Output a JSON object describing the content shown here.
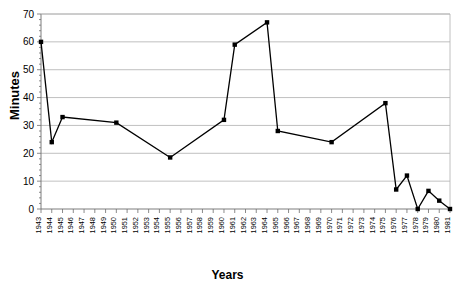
{
  "chart_data": {
    "type": "line",
    "title": "",
    "xlabel": "Years",
    "ylabel": "Minutes",
    "ylim": [
      0,
      70
    ],
    "ytick_step": 10,
    "yticks": [
      0,
      10,
      20,
      30,
      40,
      50,
      60,
      70
    ],
    "grid": true,
    "legend": false,
    "marker": "square",
    "line_color": "#000000",
    "marker_color": "#000000",
    "grid_color": "#b0b0b0",
    "background": "#ffffff",
    "x_start": 1943,
    "x_end": 1981,
    "categories": [
      "1943",
      "1944",
      "1945",
      "1946",
      "1947",
      "1948",
      "1949",
      "1950",
      "1951",
      "1952",
      "1953",
      "1954",
      "1955",
      "1956",
      "1957",
      "1958",
      "1959",
      "1960",
      "1961",
      "1962",
      "1963",
      "1964",
      "1965",
      "1966",
      "1967",
      "1968",
      "1969",
      "1970",
      "1971",
      "1972",
      "1973",
      "1974",
      "1975",
      "1976",
      "1977",
      "1978",
      "1979",
      "1980",
      "1981"
    ],
    "points": [
      {
        "x": "1943",
        "y": 60
      },
      {
        "x": "1944",
        "y": 24
      },
      {
        "x": "1945",
        "y": 33
      },
      {
        "x": "1950",
        "y": 31
      },
      {
        "x": "1955",
        "y": 18.5
      },
      {
        "x": "1960",
        "y": 32
      },
      {
        "x": "1961",
        "y": 59
      },
      {
        "x": "1964",
        "y": 67
      },
      {
        "x": "1965",
        "y": 28
      },
      {
        "x": "1970",
        "y": 24
      },
      {
        "x": "1975",
        "y": 38
      },
      {
        "x": "1976",
        "y": 7
      },
      {
        "x": "1977",
        "y": 12
      },
      {
        "x": "1978",
        "y": 0
      },
      {
        "x": "1979",
        "y": 6.5
      },
      {
        "x": "1980",
        "y": 3
      },
      {
        "x": "1981",
        "y": 0
      }
    ]
  }
}
